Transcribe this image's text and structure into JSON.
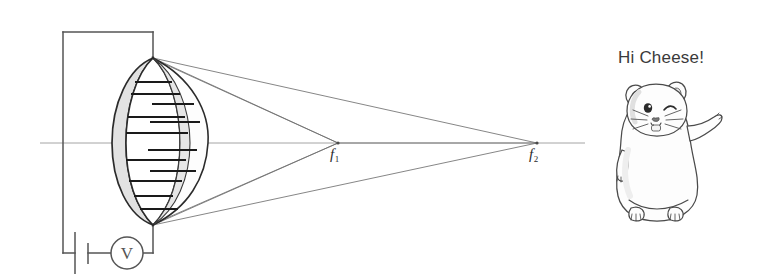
{
  "figure": {
    "type": "optics-ray-diagram",
    "background_color": "#ffffff"
  },
  "labels": {
    "focal_point_1": "f",
    "focal_point_1_sub": "1",
    "focal_point_2": "f",
    "focal_point_2_sub": "2",
    "greeting": "Hi Cheese!",
    "voltmeter": "V"
  },
  "colors": {
    "ink": "#2b2b2b",
    "ray": "#6e6e6e",
    "axis": "#8c8c8c",
    "wire": "#555555",
    "lens_fill": "#fbfbfb",
    "lens_ring_fill": "#e4e4e4",
    "text": "#3a3a3a",
    "mouse_outline": "#4a4a4a",
    "mouse_fill": "#fdfdfd",
    "mouse_shade": "#efefef"
  },
  "geometry": {
    "optical_axis": {
      "x1": 40,
      "y1": 143,
      "x2": 585,
      "y2": 143
    },
    "lens": {
      "center_x": 153,
      "center_y": 143,
      "top_vertex_y": 58,
      "bottom_vertex_y": 225,
      "front_bulge_x": 120,
      "back_bulge_x": 208
    },
    "focal_point_1": {
      "x": 338,
      "y": 143
    },
    "focal_point_2": {
      "x": 537,
      "y": 143
    },
    "circuit": {
      "left_wire_x": 63,
      "top_wire_y": 32,
      "bottom_wire_y": 253,
      "right_wire_x": 153,
      "battery_x": 81,
      "voltmeter_x": 127,
      "voltmeter_r": 16
    },
    "electrode_tick_count": 12
  },
  "annotations": {
    "lens_name": "tunable-liquid-lens",
    "source_name": "voltage-source",
    "meter_name": "voltmeter",
    "character_name": "cartoon-mouse"
  }
}
